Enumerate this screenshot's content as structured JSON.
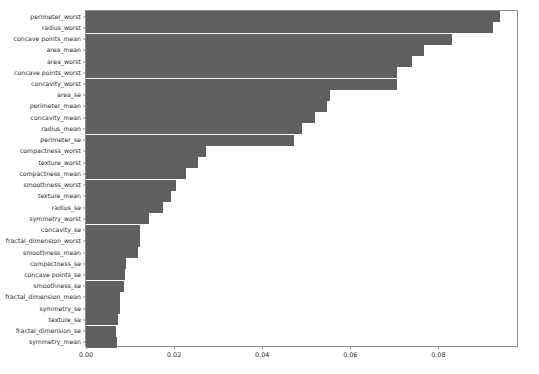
{
  "chart_data": {
    "type": "bar",
    "orientation": "horizontal",
    "title": "",
    "xlabel": "",
    "ylabel": "",
    "xlim": [
      0.0,
      0.0983
    ],
    "xticks": [
      0.0,
      0.02,
      0.04,
      0.06,
      0.08
    ],
    "xtick_labels": [
      "0.00",
      "0.02",
      "0.04",
      "0.06",
      "0.08"
    ],
    "grid": false,
    "legend": false,
    "bar_color": "#5f5f5f",
    "axes_edge_color": "#8d8d8d",
    "background": "#ffffff",
    "categories": [
      "perimeter_worst",
      "radius_worst",
      "concave points_mean",
      "area_mean",
      "area_worst",
      "concave points_worst",
      "concavity_worst",
      "area_se",
      "perimeter_mean",
      "concavity_mean",
      "radius_mean",
      "perimeter_se",
      "compactness_worst",
      "texture_worst",
      "compactness_mean",
      "smoothness_worst",
      "texture_mean",
      "radius_se",
      "symmetry_worst",
      "concavity_se",
      "fractal_dimension_worst",
      "smoothness_mean",
      "compactness_se",
      "concave points_se",
      "smoothness_se",
      "fractal_dimension_mean",
      "symmetry_se",
      "texture_se",
      "fractal_dimension_se",
      "symmetry_mean"
    ],
    "values": [
      0.0941,
      0.0923,
      0.0832,
      0.0768,
      0.0739,
      0.0705,
      0.0705,
      0.0555,
      0.0548,
      0.052,
      0.0491,
      0.0473,
      0.0273,
      0.0255,
      0.0227,
      0.0205,
      0.0193,
      0.0175,
      0.0143,
      0.0123,
      0.0123,
      0.0118,
      0.0091,
      0.0089,
      0.0086,
      0.0077,
      0.0077,
      0.0073,
      0.0068,
      0.007
    ]
  }
}
